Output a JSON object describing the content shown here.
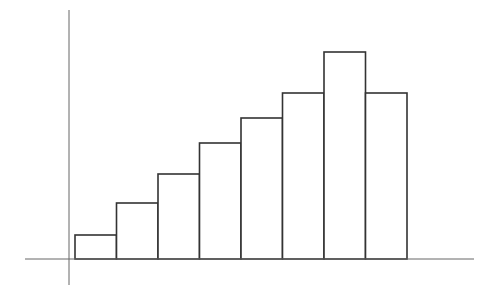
{
  "chart_data": {
    "type": "bar",
    "title": "",
    "xlabel": "",
    "ylabel": "",
    "categories": [
      "1",
      "2",
      "3",
      "4",
      "5",
      "6",
      "7",
      "8"
    ],
    "values": [
      24,
      56,
      85,
      116,
      141,
      166,
      207,
      166
    ],
    "ylim": [
      0,
      250
    ],
    "grid": false,
    "legend": null,
    "bar_gap": 0,
    "style": {
      "bar_fill": "#ffffff",
      "bar_stroke": "#333333",
      "axis_color": "#666666"
    },
    "note": "No tick labels shown; values are relative bar heights in pixels above the baseline"
  },
  "layout": {
    "baseline_y": 259,
    "yaxis_x": 69,
    "yaxis_top": 10,
    "yaxis_bottom": 285,
    "xaxis_left": 25,
    "xaxis_right": 474,
    "bar_left": 75,
    "bar_width": 41.5
  }
}
